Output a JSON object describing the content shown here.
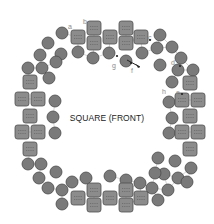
{
  "diagram": {
    "title": "SQUARE (FRONT)",
    "colors": {
      "bead_circle": "#7a7a7a",
      "bead_square": "#8c8c8c",
      "thread": "#b8b8b8",
      "label": "#8a8a8a",
      "arrow": "#222222"
    },
    "labels": [
      {
        "id": "a",
        "text": "a",
        "x": 68,
        "y": 29
      },
      {
        "id": "b",
        "text": "b",
        "x": 83,
        "y": 24
      },
      {
        "id": "c",
        "text": "c",
        "x": 148,
        "y": 40
      },
      {
        "id": "d",
        "text": "d",
        "x": 171,
        "y": 65
      },
      {
        "id": "e",
        "text": "e",
        "x": 176,
        "y": 95
      },
      {
        "id": "f",
        "text": "f",
        "x": 131,
        "y": 73
      },
      {
        "id": "g",
        "text": "g",
        "x": 112,
        "y": 68
      },
      {
        "id": "h",
        "text": "h",
        "x": 162,
        "y": 94
      }
    ],
    "arrow": {
      "from": [
        127,
        60
      ],
      "to": [
        140,
        67
      ]
    },
    "square_beads": [
      [
        78,
        37
      ],
      [
        94,
        28
      ],
      [
        94,
        43
      ],
      [
        110,
        37
      ],
      [
        126,
        28
      ],
      [
        126,
        43
      ],
      [
        141,
        37
      ],
      [
        30,
        82
      ],
      [
        22,
        99
      ],
      [
        38,
        99
      ],
      [
        30,
        116
      ],
      [
        22,
        132
      ],
      [
        38,
        132
      ],
      [
        30,
        149
      ],
      [
        190,
        83
      ],
      [
        182,
        100
      ],
      [
        198,
        100
      ],
      [
        190,
        116
      ],
      [
        182,
        132
      ],
      [
        198,
        132
      ],
      [
        190,
        149
      ],
      [
        78,
        198
      ],
      [
        94,
        190
      ],
      [
        94,
        205
      ],
      [
        110,
        198
      ],
      [
        126,
        190
      ],
      [
        126,
        205
      ],
      [
        141,
        198
      ]
    ],
    "circle_beads": [
      [
        62,
        33
      ],
      [
        48,
        43
      ],
      [
        40,
        55
      ],
      [
        28,
        68
      ],
      [
        42,
        68
      ],
      [
        78,
        52
      ],
      [
        93,
        58
      ],
      [
        109,
        53
      ],
      [
        126,
        61
      ],
      [
        142,
        53
      ],
      [
        160,
        35
      ],
      [
        157,
        48
      ],
      [
        172,
        47
      ],
      [
        181,
        58
      ],
      [
        178,
        70
      ],
      [
        193,
        70
      ],
      [
        172,
        82
      ],
      [
        160,
        65
      ],
      [
        61,
        54
      ],
      [
        56,
        62
      ],
      [
        49,
        78
      ],
      [
        55,
        101
      ],
      [
        53,
        117
      ],
      [
        55,
        133
      ],
      [
        169,
        102
      ],
      [
        172,
        118
      ],
      [
        169,
        133
      ],
      [
        28,
        164
      ],
      [
        41,
        164
      ],
      [
        39,
        178
      ],
      [
        48,
        188
      ],
      [
        62,
        190
      ],
      [
        62,
        204
      ],
      [
        56,
        172
      ],
      [
        72,
        182
      ],
      [
        86,
        178
      ],
      [
        110,
        176
      ],
      [
        126,
        180
      ],
      [
        140,
        183
      ],
      [
        152,
        188
      ],
      [
        158,
        200
      ],
      [
        168,
        190
      ],
      [
        178,
        178
      ],
      [
        191,
        168
      ],
      [
        187,
        182
      ],
      [
        175,
        161
      ],
      [
        164,
        174
      ],
      [
        155,
        173
      ],
      [
        158,
        158
      ]
    ]
  }
}
